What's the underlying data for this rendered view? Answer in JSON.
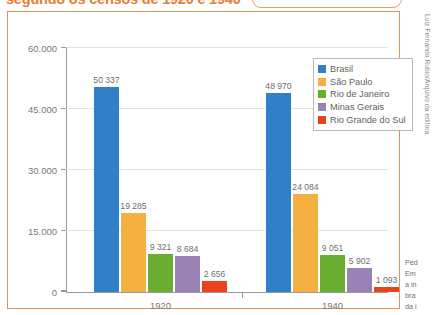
{
  "page": {
    "title": "segundo os censos de 1920 e 1940",
    "credit": "Luiz Fernando Rubio/Arquivo da editora",
    "body_lines": [
      "Ped",
      "Em",
      "a in",
      "bra",
      "da i",
      "194"
    ]
  },
  "chart_data": {
    "type": "bar",
    "title": "segundo os censos de 1920 e 1940",
    "xlabel": "",
    "ylabel": "",
    "categories": [
      "1920",
      "1940"
    ],
    "ylim": [
      0,
      60000
    ],
    "yticks": [
      0,
      15000,
      30000,
      45000,
      60000
    ],
    "ytick_labels": [
      "0",
      "15.000",
      "30.000",
      "45.000",
      "60.000"
    ],
    "grid": true,
    "legend_position": "top-right",
    "series": [
      {
        "name": "Brasil",
        "color": "#3080C8",
        "values": [
          50337,
          48970
        ],
        "labels": [
          "50 337",
          "48 970"
        ]
      },
      {
        "name": "São Paulo",
        "color": "#F5B042",
        "values": [
          19285,
          24084
        ],
        "labels": [
          "19 285",
          "24 084"
        ]
      },
      {
        "name": "Rio de Janeiro",
        "color": "#6AAD30",
        "values": [
          9321,
          9051
        ],
        "labels": [
          "9 321",
          "9 051"
        ]
      },
      {
        "name": "Minas Gerais",
        "color": "#9B82B5",
        "values": [
          8684,
          5902
        ],
        "labels": [
          "8 684",
          "5 902"
        ]
      },
      {
        "name": "Rio Grande do Sul",
        "color": "#E8421C",
        "values": [
          2656,
          1093
        ],
        "labels": [
          "2 656",
          "1 093"
        ]
      }
    ]
  }
}
